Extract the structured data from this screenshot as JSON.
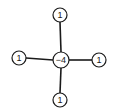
{
  "diagram": {
    "title": "",
    "type": "laplacian-stencil",
    "nodes": [
      {
        "id": "center",
        "label": "−4",
        "cx": 61,
        "cy": 60,
        "r": 8
      },
      {
        "id": "top",
        "label": "1",
        "cx": 60,
        "cy": 15,
        "r": 7
      },
      {
        "id": "left",
        "label": "1",
        "cx": 19,
        "cy": 58,
        "r": 7
      },
      {
        "id": "right",
        "label": "1",
        "cx": 99,
        "cy": 60,
        "r": 7
      },
      {
        "id": "bottom",
        "label": "1",
        "cx": 60,
        "cy": 100,
        "r": 7
      }
    ],
    "edges": [
      {
        "from": "center",
        "to": "top"
      },
      {
        "from": "center",
        "to": "left"
      },
      {
        "from": "center",
        "to": "right"
      },
      {
        "from": "center",
        "to": "bottom"
      }
    ],
    "colors": {
      "stroke": "#1a1a1a",
      "background": "#ffffff"
    }
  }
}
